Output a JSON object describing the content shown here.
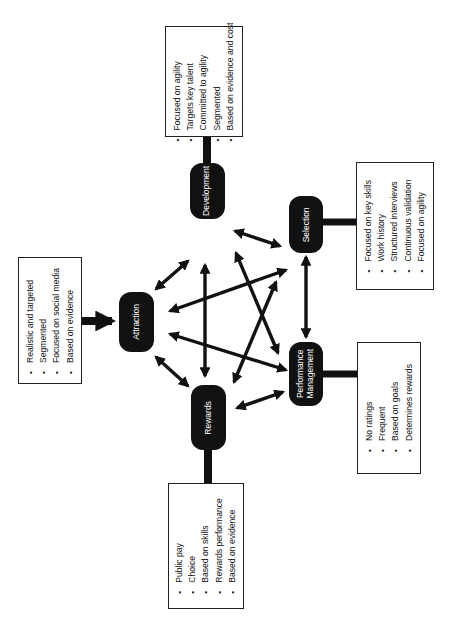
{
  "diagram": {
    "nodes": {
      "attraction": {
        "label": "Attraction"
      },
      "development": {
        "label": "Development"
      },
      "selection": {
        "label": "Selection"
      },
      "performance": {
        "label_line1": "Performance",
        "label_line2": "Management"
      },
      "rewards": {
        "label": "Rewards"
      }
    },
    "boxes": {
      "attraction": {
        "items": [
          "Realistic and targeted",
          "Segmented",
          "Focused on social media",
          "Based on evidence"
        ]
      },
      "development": {
        "items": [
          "Focused on agility",
          "Targets key talent",
          "Committed to agility",
          "Segmented",
          "Based on evidence and cost"
        ]
      },
      "selection": {
        "items": [
          "Focused on key skills",
          "Work history",
          "Structured interviews",
          "Continuous validation",
          "Focused on agility"
        ]
      },
      "performance": {
        "items": [
          "No ratings",
          "Frequent",
          "Based on goals",
          "Determines rewards"
        ]
      },
      "rewards": {
        "items": [
          "Public pay",
          "Choice",
          "Based on skills",
          "Rewards performance",
          "Based on evidence"
        ]
      }
    },
    "connections": [
      {
        "from": "Attraction box",
        "to": "Attraction",
        "type": "single-arrow"
      },
      {
        "from": "Development box",
        "to": "Development",
        "type": "line"
      },
      {
        "from": "Selection box",
        "to": "Selection",
        "type": "line"
      },
      {
        "from": "Performance Management box",
        "to": "Performance Management",
        "type": "line"
      },
      {
        "from": "Rewards box",
        "to": "Rewards",
        "type": "line"
      },
      {
        "from": "Attraction",
        "to": "Development",
        "type": "double-arrow"
      },
      {
        "from": "Attraction",
        "to": "Selection",
        "type": "double-arrow"
      },
      {
        "from": "Attraction",
        "to": "Performance Management",
        "type": "double-arrow"
      },
      {
        "from": "Attraction",
        "to": "Rewards",
        "type": "double-arrow"
      },
      {
        "from": "Development",
        "to": "Selection",
        "type": "double-arrow"
      },
      {
        "from": "Development",
        "to": "Performance Management",
        "type": "double-arrow"
      },
      {
        "from": "Development",
        "to": "Rewards",
        "type": "double-arrow"
      },
      {
        "from": "Selection",
        "to": "Performance Management",
        "type": "double-arrow"
      },
      {
        "from": "Selection",
        "to": "Rewards",
        "type": "double-arrow"
      },
      {
        "from": "Performance Management",
        "to": "Rewards",
        "type": "double-arrow"
      }
    ],
    "colors": {
      "node_fill": "#111111",
      "node_text": "#ffffff",
      "line": "#111111",
      "box_border": "#222222",
      "background": "#ffffff"
    }
  }
}
